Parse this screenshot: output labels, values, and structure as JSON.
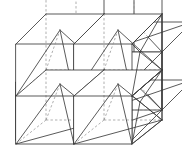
{
  "figure": {
    "projection": "oblique-cavalier",
    "canvas": {
      "width": 182,
      "height": 152
    },
    "colors": {
      "background": "#ffffff",
      "visible_edge": "#3c3c3c",
      "hidden_edge": "#8c8c8c",
      "face": "#ffffff"
    },
    "geometry": {
      "cube_size": 58,
      "depth_dx": 30,
      "depth_dy": -30,
      "origin_x": 16,
      "origin_y": 140,
      "columns": 2,
      "rows": 2,
      "layers": 2,
      "pyramid_apex_fraction": 1.0
    },
    "cells": [
      {
        "name": "cell-front-bottom-left",
        "col": 0,
        "row": 0,
        "layer": 0
      },
      {
        "name": "cell-front-bottom-right",
        "col": 1,
        "row": 0,
        "layer": 0
      },
      {
        "name": "cell-front-top-left",
        "col": 0,
        "row": 1,
        "layer": 0
      },
      {
        "name": "cell-front-top-right",
        "col": 1,
        "row": 1,
        "layer": 0
      },
      {
        "name": "cell-back-bottom-left",
        "col": 0,
        "row": 0,
        "layer": 1
      },
      {
        "name": "cell-back-bottom-right",
        "col": 1,
        "row": 0,
        "layer": 1
      },
      {
        "name": "cell-back-top-left",
        "col": 0,
        "row": 1,
        "layer": 1
      },
      {
        "name": "cell-back-top-right",
        "col": 1,
        "row": 1,
        "layer": 1
      }
    ],
    "legend": {
      "solid_meaning": "visible edge",
      "dashed_meaning": "hidden edge"
    },
    "caption": ""
  }
}
